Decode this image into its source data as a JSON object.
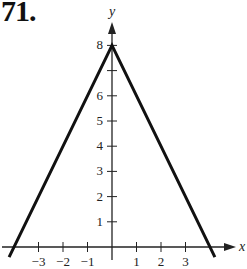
{
  "problem_number": "71.",
  "chart_data": {
    "type": "line",
    "title": "",
    "xlabel": "x",
    "ylabel": "y",
    "equation_implied": "y = 8 - 2|x|",
    "series": [
      {
        "name": "graph",
        "x": [
          -4.2,
          0,
          4.2
        ],
        "y": [
          -0.4,
          8,
          -0.4
        ]
      }
    ],
    "key_points": [
      {
        "label": "vertex",
        "x": 0,
        "y": 8
      },
      {
        "label": "x-intercept",
        "x": -4,
        "y": 0
      },
      {
        "label": "x-intercept",
        "x": 4,
        "y": 0
      }
    ],
    "x_ticks": [
      -3,
      -2,
      -1,
      1,
      2,
      3
    ],
    "x_tick_labels": [
      "−3",
      "−2",
      "−1",
      "1",
      "2",
      "3"
    ],
    "y_ticks": [
      1,
      2,
      3,
      4,
      5,
      6,
      7,
      8
    ],
    "y_tick_labels": [
      "1",
      "2",
      "3",
      "4",
      "5",
      "6",
      "",
      "8"
    ],
    "xlim": [
      -4.5,
      5
    ],
    "ylim": [
      -0.8,
      9.5
    ],
    "grid": false,
    "legend": null
  }
}
